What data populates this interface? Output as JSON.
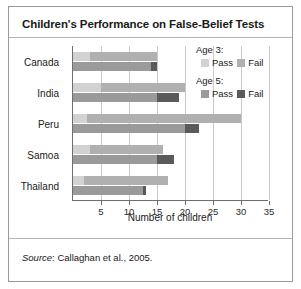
{
  "title": "Children's Performance on False-Belief Tests",
  "source": {
    "prefix": "Source",
    "text": ": Callaghan et al., 2005."
  },
  "legend": {
    "groups": [
      {
        "heading": "Age 3:",
        "items": [
          {
            "label": "Pass",
            "color": "#d2d2d2",
            "icon": "legend-swatch"
          },
          {
            "label": "Fail",
            "color": "#b0b0b0",
            "icon": "legend-swatch"
          }
        ]
      },
      {
        "heading": "Age 5:",
        "items": [
          {
            "label": "Pass",
            "color": "#9a9a9a",
            "icon": "legend-swatch"
          },
          {
            "label": "Fail",
            "color": "#5a5a5a",
            "icon": "legend-swatch"
          }
        ]
      }
    ]
  },
  "chart_data": {
    "type": "bar",
    "orientation": "horizontal",
    "stacked": true,
    "title": "Children's Performance on False-Belief Tests",
    "xlabel": "Number of children",
    "ylabel": "",
    "xlim": [
      0,
      35
    ],
    "xticks": [
      5,
      10,
      15,
      20,
      25,
      30,
      35
    ],
    "grid": "vertical",
    "legend_position": "right",
    "categories": [
      "Canada",
      "India",
      "Peru",
      "Samoa",
      "Thailand"
    ],
    "series": [
      {
        "name": "Age 3: Pass",
        "color": "#d2d2d2",
        "values": [
          3.0,
          5.0,
          2.5,
          3.0,
          2.0
        ]
      },
      {
        "name": "Age 3: Fail",
        "color": "#b0b0b0",
        "values": [
          12.0,
          15.0,
          27.5,
          13.0,
          15.0
        ]
      },
      {
        "name": "Age 5: Pass",
        "color": "#9a9a9a",
        "values": [
          14.0,
          15.0,
          20.0,
          15.0,
          12.5
        ]
      },
      {
        "name": "Age 5: Fail",
        "color": "#5a5a5a",
        "values": [
          1.0,
          4.0,
          2.5,
          3.0,
          0.5
        ]
      }
    ],
    "totals": {
      "age3": [
        15.0,
        20.0,
        30.0,
        16.0,
        17.0
      ],
      "age5": [
        15.0,
        19.0,
        22.5,
        18.0,
        13.0
      ]
    }
  }
}
